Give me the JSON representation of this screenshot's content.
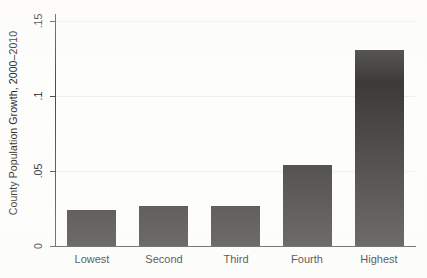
{
  "chart_data": {
    "type": "bar",
    "title": "",
    "subtitle": "",
    "xlabel": "",
    "ylabel": "County Population Growth, 2000–2010",
    "categories": [
      "Lowest",
      "Second",
      "Third",
      "Fourth",
      "Highest"
    ],
    "values": [
      0.024,
      0.027,
      0.027,
      0.054,
      0.131
    ],
    "ylim": [
      0,
      0.155
    ],
    "yticks": [
      0,
      0.05,
      0.1,
      0.15
    ],
    "ytick_labels": [
      "0",
      ".05",
      ".1",
      ".15"
    ],
    "grid": true,
    "grid_axis": "y",
    "legend": "none",
    "bar_color": "#3d3b3a",
    "background_color": "#fdfdfc",
    "axis_color": "#4a4a4a",
    "series": [
      {
        "name": "County Population Growth, 2000–2010",
        "values": [
          0.024,
          0.027,
          0.027,
          0.054,
          0.131
        ]
      }
    ]
  },
  "axis": {
    "y_title": "County Population Growth, 2000–2010",
    "ticks": [
      {
        "label": ".15",
        "value": 0.15
      },
      {
        "label": ".1",
        "value": 0.1
      },
      {
        "label": ".05",
        "value": 0.05
      },
      {
        "label": "0",
        "value": 0
      }
    ]
  },
  "bars": [
    {
      "label": "Lowest",
      "value": 0.024
    },
    {
      "label": "Second",
      "value": 0.027
    },
    {
      "label": "Third",
      "value": 0.027
    },
    {
      "label": "Fourth",
      "value": 0.054
    },
    {
      "label": "Highest",
      "value": 0.131
    }
  ]
}
